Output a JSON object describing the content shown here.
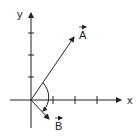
{
  "diagram": {
    "type": "vector-diagram",
    "axes": {
      "x_label": "x",
      "y_label": "y",
      "x_ticks": 3,
      "y_ticks": 3
    },
    "vectors": [
      {
        "name": "A",
        "label": "A",
        "has_arrow_over_label": true,
        "direction": "up-right"
      },
      {
        "name": "B",
        "label": "B",
        "has_arrow_over_label": true,
        "direction": "down-right"
      }
    ],
    "angle_arc": {
      "from": "A",
      "to": "B",
      "arrow_at": "B"
    },
    "colors": {
      "ink": "#222222",
      "background": "#ffffff"
    }
  }
}
